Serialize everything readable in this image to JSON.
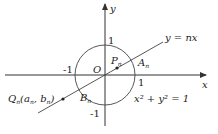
{
  "diagram": {
    "axes": {
      "x_label": "x",
      "y_label": "y",
      "origin_label": "O"
    },
    "ticks": {
      "x_pos": "1",
      "x_neg": "-1",
      "y_pos": "1",
      "y_neg": "-1"
    },
    "circle": {
      "equation": "x² + y² = 1",
      "radius": 1
    },
    "line": {
      "equation": "y = nx"
    },
    "points": {
      "P": {
        "name": "P",
        "sub": "n"
      },
      "A": {
        "name": "A",
        "sub": "n"
      },
      "B": {
        "name": "B",
        "sub": "n"
      },
      "Q": {
        "name": "Q",
        "sub": "n",
        "coords": "(a",
        "coord_a_sub": "n",
        "sep": ", b",
        "coord_b_sub": "n",
        "close": ")"
      }
    },
    "colors": {
      "stroke": "#333333",
      "background": "#ffffff"
    }
  }
}
